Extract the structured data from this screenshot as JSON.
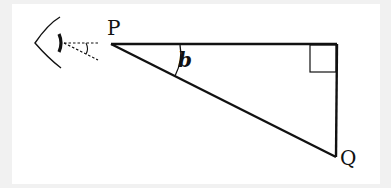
{
  "diagram": {
    "labels": {
      "point_p": "P",
      "point_q": "Q",
      "angle": "b"
    },
    "elements": {
      "observer": "eye-icon",
      "line_of_sight": "dashed-sight-lines",
      "right_angle_marker": "square-marker",
      "triangle": "right-triangle"
    },
    "colors": {
      "stroke": "#111111",
      "background": "#ffffff",
      "page": "#f1f1f1"
    }
  }
}
